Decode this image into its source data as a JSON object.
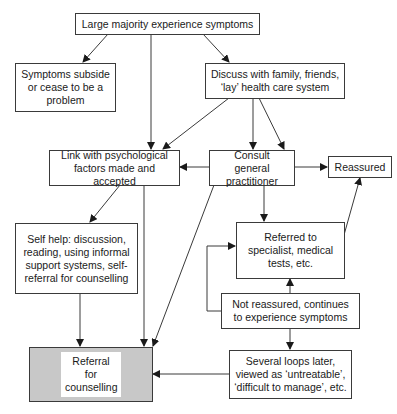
{
  "diagram": {
    "nodes": {
      "start": "Large majority experience symptoms",
      "subside": "Symptoms subside or cease to be a problem",
      "discuss": "Discuss with family, friends, ‘lay’ health care system",
      "link": "Link with psychological factors made and accepted",
      "consult": "Consult general practitioner",
      "reassured": "Reassured",
      "selfhelp": "Self help: discussion, reading, using informal support systems, self-referral for counselling",
      "referred": "Referred to specialist, medical tests, etc.",
      "not_reassured": "Not reassured, continues to experience symptoms",
      "loops": "Several loops later, viewed as ‘untreatable’, ‘difficult to manage’, etc.",
      "referral": "Referral for counselling"
    },
    "edges": [
      {
        "from": "start",
        "to": "subside"
      },
      {
        "from": "start",
        "to": "link"
      },
      {
        "from": "start",
        "to": "discuss"
      },
      {
        "from": "discuss",
        "to": "link"
      },
      {
        "from": "discuss",
        "to": "consult"
      },
      {
        "from": "discuss",
        "to": "consult"
      },
      {
        "from": "consult",
        "to": "link"
      },
      {
        "from": "consult",
        "to": "reassured"
      },
      {
        "from": "consult",
        "to": "referred"
      },
      {
        "from": "consult",
        "to": "referral"
      },
      {
        "from": "link",
        "to": "selfhelp"
      },
      {
        "from": "link",
        "to": "referral"
      },
      {
        "from": "selfhelp",
        "to": "referral"
      },
      {
        "from": "referred",
        "to": "reassured"
      },
      {
        "from": "not_reassured",
        "to": "referred"
      },
      {
        "from": "not_reassured",
        "to": "referred"
      },
      {
        "from": "not_reassured",
        "to": "loops"
      },
      {
        "from": "loops",
        "to": "referral"
      }
    ],
    "colors": {
      "line": "#3a3a3a",
      "highlight_fill": "#c8c8c8"
    }
  }
}
